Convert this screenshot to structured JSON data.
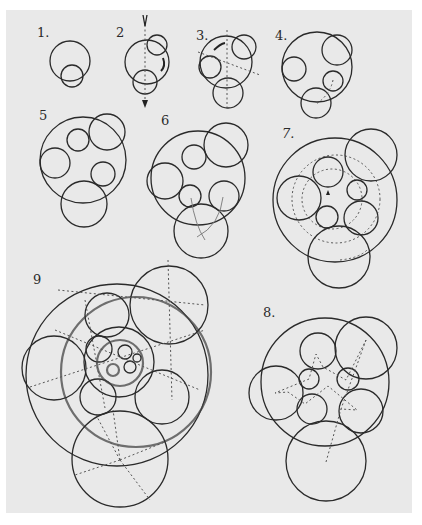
{
  "figure": {
    "labels": [
      "1.",
      "2",
      "3.",
      "4.",
      "5",
      "6",
      "7.",
      "8.",
      "9"
    ],
    "paper_color": "#e9e9e9",
    "ink_color": "#2a2a2a"
  },
  "panels": [
    {
      "id": 1,
      "label": "1.",
      "description": "large circle with one small circle at bottom"
    },
    {
      "id": 2,
      "label": "2",
      "description": "circle with two small circles on vertical axis and rotation arrows"
    },
    {
      "id": 3,
      "label": "3.",
      "description": "circle with three inner circles and dotted axes"
    },
    {
      "id": 4,
      "label": "4.",
      "description": "circle with four inner circles"
    },
    {
      "id": 5,
      "label": "5",
      "description": "circle with five inner circles"
    },
    {
      "id": 6,
      "label": "6",
      "description": "circle with six inner circles and curved guide lines"
    },
    {
      "id": 7,
      "label": "7.",
      "description": "circle with seven inner circles and dashed concentric guides"
    },
    {
      "id": 8,
      "label": "8.",
      "description": "circle with nested circles and dotted star construction"
    },
    {
      "id": 9,
      "label": "9",
      "description": "complex nested circles with recursive inner circles and dotted radial lines"
    }
  ]
}
